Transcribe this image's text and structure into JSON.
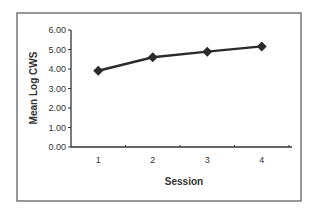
{
  "chart_data": {
    "type": "line",
    "title": "",
    "xlabel": "Session",
    "ylabel": "Mean Log CWS",
    "categories": [
      "1",
      "2",
      "3",
      "4"
    ],
    "series": [
      {
        "name": "Mean Log CWS",
        "values": [
          3.91,
          4.6,
          4.89,
          5.16
        ],
        "color": "#2b2b2b",
        "marker": "diamond"
      }
    ],
    "ylim": [
      0,
      6
    ],
    "yticks": [
      "0.00",
      "1.00",
      "2.00",
      "3.00",
      "4.00",
      "5.00",
      "6.00"
    ],
    "grid": false,
    "legend": "none"
  },
  "colors": {
    "line": "#2b2b2b",
    "axis": "#333333",
    "border": "#555555",
    "background": "#ffffff"
  }
}
